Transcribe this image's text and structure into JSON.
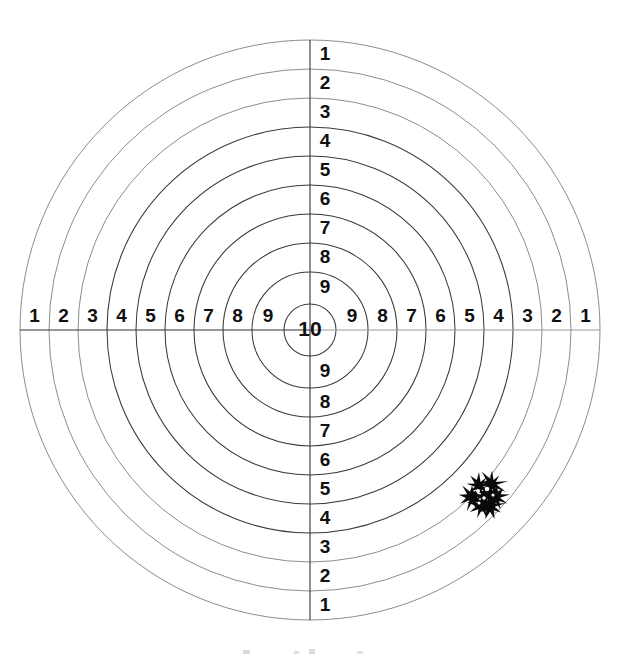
{
  "document": {
    "kind": "shooting-target-scorecard",
    "background_color": "#ffffff",
    "ink_color": "#101010",
    "ring_color": "#3a3a3a",
    "faded_ring_color": "#8d8d8d",
    "width": 621,
    "height": 657
  },
  "target": {
    "center_x": 310,
    "center_y": 330,
    "outer_radius": 290,
    "ring_count": 10,
    "ring_step": 29,
    "bull_radius": 26,
    "bull_label": "10",
    "ring_radii": [
      290,
      261,
      232,
      203,
      174,
      145,
      116,
      87,
      58,
      26
    ]
  },
  "labels": {
    "vertical_top": [
      "1",
      "2",
      "3",
      "4",
      "5",
      "6",
      "7",
      "8",
      "9"
    ],
    "vertical_bottom": [
      "9",
      "8",
      "7",
      "6",
      "5",
      "4",
      "3",
      "2",
      "1"
    ],
    "horizontal_left": [
      "1",
      "2",
      "3",
      "4",
      "5",
      "6",
      "7",
      "8",
      "9"
    ],
    "horizontal_right": [
      "9",
      "8",
      "7",
      "6",
      "5",
      "4",
      "3",
      "2",
      "1"
    ],
    "center": "10"
  },
  "chart_data": {
    "type": "scatter",
    "title": "",
    "subtitle": "",
    "xlabel": "",
    "ylabel": "",
    "rings": [
      {
        "score": 1,
        "radius_px": 290
      },
      {
        "score": 2,
        "radius_px": 261
      },
      {
        "score": 3,
        "radius_px": 232
      },
      {
        "score": 4,
        "radius_px": 203
      },
      {
        "score": 5,
        "radius_px": 174
      },
      {
        "score": 6,
        "radius_px": 145
      },
      {
        "score": 7,
        "radius_px": 116
      },
      {
        "score": 8,
        "radius_px": 87
      },
      {
        "score": 9,
        "radius_px": 58
      },
      {
        "score": 10,
        "radius_px": 26
      }
    ],
    "axis_tick_labels_vertical": [
      "1",
      "2",
      "3",
      "4",
      "5",
      "6",
      "7",
      "8",
      "9",
      "10",
      "9",
      "8",
      "7",
      "6",
      "5",
      "4",
      "3",
      "2",
      "1"
    ],
    "axis_tick_labels_horizontal": [
      "1",
      "2",
      "3",
      "4",
      "5",
      "6",
      "7",
      "8",
      "9",
      "10",
      "9",
      "8",
      "7",
      "6",
      "5",
      "4",
      "3",
      "2",
      "1"
    ],
    "shot_group": {
      "count": 7,
      "center_px": {
        "x": 486,
        "y": 495
      },
      "spread_px": 38,
      "score_band": "4-5",
      "quadrant": "lower-right"
    },
    "shots": [
      {
        "x": 472,
        "y": 497,
        "score": 4
      },
      {
        "x": 479,
        "y": 486,
        "score": 5
      },
      {
        "x": 487,
        "y": 493,
        "score": 4
      },
      {
        "x": 492,
        "y": 484,
        "score": 5
      },
      {
        "x": 496,
        "y": 497,
        "score": 4
      },
      {
        "x": 482,
        "y": 505,
        "score": 4
      },
      {
        "x": 490,
        "y": 506,
        "score": 4
      }
    ],
    "legend": [],
    "grid": false
  }
}
